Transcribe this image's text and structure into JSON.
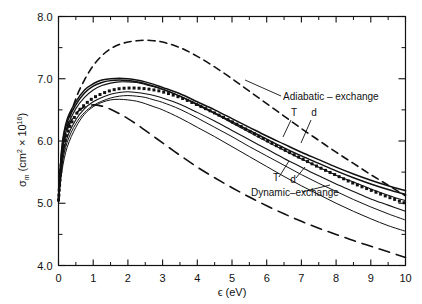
{
  "figure": {
    "background": "#ffffff",
    "ink": "#111111"
  },
  "chart_data": {
    "type": "line",
    "title": "",
    "xlabel": "ϵ (eV)",
    "ylabel": "σ",
    "ylabel_sub": "m",
    "ylabel_units_pre": "(cm",
    "ylabel_units_sup1": "2",
    "ylabel_units_mid": " × 10",
    "ylabel_units_sup2": "16",
    "ylabel_units_post": ")",
    "xlim": [
      0,
      10
    ],
    "ylim": [
      4.0,
      8.0
    ],
    "grid": false,
    "legend_position": "inline-annotations",
    "xticks": [
      0,
      1,
      2,
      3,
      4,
      5,
      6,
      7,
      8,
      9,
      10
    ],
    "xticklabels": [
      "0",
      "1",
      "2",
      "3",
      "4",
      "5",
      "6",
      "7",
      "8",
      "9",
      "10"
    ],
    "xminorticks": [
      0.5,
      1.5,
      2.5,
      3.5,
      4.5,
      5.5,
      6.5,
      7.5,
      8.5,
      9.5
    ],
    "yticks": [
      4.0,
      5.0,
      6.0,
      7.0,
      8.0
    ],
    "yticklabels": [
      "4.0",
      "5.0",
      "6.0",
      "7.0",
      "8.0"
    ],
    "yminorticks": [
      4.5,
      5.5,
      6.5,
      7.5
    ],
    "x": [
      0,
      0.1,
      0.25,
      0.5,
      0.75,
      1.0,
      1.25,
      1.5,
      1.75,
      2.0,
      2.25,
      2.5,
      2.75,
      3.0,
      3.5,
      4.0,
      4.5,
      5.0,
      5.5,
      6.0,
      6.5,
      7.0,
      7.5,
      8.0,
      8.5,
      9.0,
      9.5,
      10.0
    ],
    "series": [
      {
        "name": "upper-dashed",
        "style": "dashed",
        "width": 1.6,
        "values": [
          5.05,
          5.72,
          6.22,
          6.68,
          6.98,
          7.21,
          7.37,
          7.48,
          7.55,
          7.59,
          7.61,
          7.62,
          7.61,
          7.59,
          7.5,
          7.36,
          7.19,
          7.0,
          6.8,
          6.6,
          6.4,
          6.2,
          6.01,
          5.82,
          5.64,
          5.46,
          5.29,
          5.12
        ]
      },
      {
        "name": "lower-long-dashed",
        "style": "long-dashed",
        "width": 1.6,
        "values": [
          5.05,
          5.78,
          6.18,
          6.44,
          6.55,
          6.58,
          6.56,
          6.51,
          6.44,
          6.36,
          6.27,
          6.17,
          6.07,
          5.97,
          5.77,
          5.58,
          5.41,
          5.25,
          5.1,
          4.96,
          4.83,
          4.71,
          4.6,
          4.5,
          4.4,
          4.31,
          4.22,
          4.13
        ]
      },
      {
        "name": "solid-top-1",
        "style": "solid",
        "width": 1.5,
        "values": [
          5.05,
          5.92,
          6.35,
          6.63,
          6.82,
          6.92,
          6.98,
          7.0,
          7.01,
          7.0,
          6.98,
          6.95,
          6.91,
          6.86,
          6.76,
          6.63,
          6.5,
          6.36,
          6.22,
          6.08,
          5.95,
          5.82,
          5.7,
          5.58,
          5.47,
          5.37,
          5.28,
          5.2
        ]
      },
      {
        "name": "solid-top-2",
        "style": "solid",
        "width": 1.5,
        "values": [
          5.05,
          5.88,
          6.3,
          6.58,
          6.77,
          6.88,
          6.94,
          6.97,
          6.98,
          6.97,
          6.95,
          6.92,
          6.88,
          6.83,
          6.72,
          6.59,
          6.45,
          6.31,
          6.17,
          6.03,
          5.89,
          5.76,
          5.64,
          5.52,
          5.41,
          5.31,
          5.22,
          5.14
        ]
      },
      {
        "name": "solid-mid-1",
        "style": "solid",
        "width": 1.1,
        "values": [
          5.05,
          5.8,
          6.22,
          6.52,
          6.7,
          6.82,
          6.89,
          6.93,
          6.95,
          6.95,
          6.94,
          6.91,
          6.87,
          6.83,
          6.72,
          6.58,
          6.44,
          6.29,
          6.14,
          5.99,
          5.85,
          5.71,
          5.58,
          5.45,
          5.34,
          5.23,
          5.13,
          5.04
        ]
      },
      {
        "name": "dotted-series",
        "style": "dotted",
        "width": 1.2,
        "values": [
          5.05,
          5.73,
          6.12,
          6.42,
          6.58,
          6.69,
          6.76,
          6.81,
          6.84,
          6.85,
          6.85,
          6.84,
          6.82,
          6.79,
          6.7,
          6.58,
          6.45,
          6.31,
          6.16,
          6.01,
          5.86,
          5.72,
          5.58,
          5.45,
          5.32,
          5.21,
          5.1,
          5.0
        ]
      },
      {
        "name": "solid-lower-1",
        "style": "solid",
        "width": 1.1,
        "values": [
          5.05,
          5.68,
          6.05,
          6.34,
          6.52,
          6.63,
          6.7,
          6.75,
          6.78,
          6.79,
          6.78,
          6.76,
          6.73,
          6.69,
          6.59,
          6.46,
          6.32,
          6.17,
          6.02,
          5.87,
          5.72,
          5.58,
          5.44,
          5.31,
          5.19,
          5.07,
          4.97,
          4.87
        ]
      },
      {
        "name": "solid-lower-2",
        "style": "solid",
        "width": 1.0,
        "values": [
          5.05,
          5.6,
          5.98,
          6.28,
          6.46,
          6.57,
          6.64,
          6.69,
          6.72,
          6.73,
          6.72,
          6.7,
          6.66,
          6.62,
          6.51,
          6.37,
          6.22,
          6.07,
          5.91,
          5.76,
          5.61,
          5.46,
          5.32,
          5.19,
          5.06,
          4.94,
          4.83,
          4.73
        ]
      },
      {
        "name": "solid-lower-3",
        "style": "solid",
        "width": 1.0,
        "values": [
          5.05,
          5.52,
          5.9,
          6.22,
          6.43,
          6.55,
          6.62,
          6.66,
          6.67,
          6.66,
          6.64,
          6.6,
          6.55,
          6.5,
          6.37,
          6.22,
          6.07,
          5.91,
          5.75,
          5.59,
          5.43,
          5.28,
          5.14,
          5.0,
          4.87,
          4.75,
          4.64,
          4.55
        ]
      }
    ],
    "annotations": [
      {
        "id": "adiabatic",
        "text": "Adiabatic – exchange"
      },
      {
        "id": "adiabatic-T",
        "text": "T"
      },
      {
        "id": "adiabatic-d",
        "text": "d"
      },
      {
        "id": "dynamic",
        "text": "Dynamic–exchange"
      },
      {
        "id": "dynamic-T",
        "text": "T"
      },
      {
        "id": "dynamic-d",
        "text": "d"
      }
    ]
  }
}
